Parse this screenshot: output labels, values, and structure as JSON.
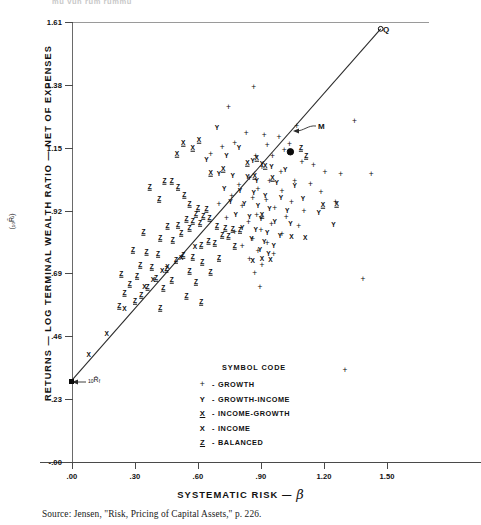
{
  "top_cut_text": "mu  vun  rum  rummu",
  "source_note": "Source: Jensen, \"Risk, Pricing of Capital Assets,\" p. 226.",
  "axis": {
    "y_title": "RETURNS  —  LOG TERMINAL WEALTH RATIO  —  NET OF EXPENSES",
    "y_subscript": "(₁₀R̄ᵢ)",
    "x_title": "SYSTEMATIC RISK  —",
    "x_symbol": "β"
  },
  "legend": {
    "title": "SYMBOL CODE",
    "dash": "-",
    "items": [
      {
        "symbol": "+",
        "style": "plus",
        "label": "GROWTH"
      },
      {
        "symbol": "Y",
        "style": "plain",
        "label": "GROWTH-INCOME"
      },
      {
        "symbol": "X",
        "style": "underline",
        "label": "INCOME-GROWTH"
      },
      {
        "symbol": "X",
        "style": "plain",
        "label": "INCOME"
      },
      {
        "symbol": "Z",
        "style": "underline",
        "label": "BALANCED"
      }
    ]
  },
  "annotations": [
    {
      "name": "market-portfolio-label",
      "text": "M",
      "x": 318,
      "y": 128
    },
    {
      "name": "q-point-label",
      "text": "Q",
      "x": 383,
      "y": 31
    },
    {
      "name": "riskfree-rate-label",
      "text": "₁₀R̄f",
      "x": 88,
      "y": 380
    }
  ],
  "chart_data": {
    "type": "scatter",
    "title": "",
    "xlabel": "SYSTEMATIC RISK — β",
    "ylabel": "RETURNS — LOG TERMINAL WEALTH RATIO — NET OF EXPENSES (₁₀R̄ᵢ)",
    "xlim": [
      0.0,
      1.7
    ],
    "ylim": [
      -0.0,
      1.61
    ],
    "xticks": [
      0.0,
      0.3,
      0.6,
      0.9,
      1.2,
      1.5
    ],
    "xticklabels": [
      ".00",
      ".30",
      ".60",
      ".90",
      "1.20",
      "1.50"
    ],
    "yticks": [
      0.0,
      0.23,
      0.46,
      0.69,
      0.92,
      1.15,
      1.38,
      1.61
    ],
    "yticklabels": [
      "-.00",
      ".23",
      ".46",
      ".69",
      ".92",
      "1.15",
      "1.38",
      "1.61"
    ],
    "grid": false,
    "legend_position": "inside-lower-center",
    "regression_line": {
      "name": "market-line",
      "label": "Security Market Line",
      "x_start": 0.0,
      "y_start": 0.3,
      "x_end": 1.47,
      "y_end": 1.585
    },
    "reference_points": [
      {
        "label": "₁₀R̄f",
        "x": 0.0,
        "y": 0.3
      },
      {
        "label": "M",
        "x": 1.04,
        "y": 1.135
      },
      {
        "label": "Q",
        "x": 1.47,
        "y": 1.585
      }
    ],
    "series": [
      {
        "name": "GROWTH",
        "symbol": "+",
        "style": "plus",
        "points": [
          [
            0.865,
            1.372
          ],
          [
            0.745,
            1.3
          ],
          [
            1.07,
            1.23
          ],
          [
            1.345,
            1.248
          ],
          [
            0.83,
            1.205
          ],
          [
            0.915,
            1.196
          ],
          [
            0.985,
            1.19
          ],
          [
            1.035,
            1.165
          ],
          [
            0.775,
            1.168
          ],
          [
            0.715,
            1.152
          ],
          [
            0.93,
            1.16
          ],
          [
            1.01,
            1.14
          ],
          [
            0.875,
            1.121
          ],
          [
            0.955,
            1.118
          ],
          [
            0.66,
            1.128
          ],
          [
            1.095,
            1.098
          ],
          [
            1.15,
            1.085
          ],
          [
            0.905,
            1.078
          ],
          [
            0.995,
            1.062
          ],
          [
            1.205,
            1.06
          ],
          [
            1.28,
            1.052
          ],
          [
            1.425,
            1.055
          ],
          [
            0.845,
            1.04
          ],
          [
            0.94,
            1.03
          ],
          [
            1.06,
            1.028
          ],
          [
            1.135,
            1.018
          ],
          [
            0.795,
            1.015
          ],
          [
            0.885,
            0.998
          ],
          [
            1.0,
            0.992
          ],
          [
            1.185,
            0.988
          ],
          [
            0.76,
            0.975
          ],
          [
            0.86,
            0.966
          ],
          [
            0.925,
            0.958
          ],
          [
            1.045,
            0.95
          ],
          [
            1.255,
            0.95
          ],
          [
            0.7,
            0.944
          ],
          [
            0.81,
            0.935
          ],
          [
            0.965,
            0.928
          ],
          [
            1.105,
            0.92
          ],
          [
            0.88,
            0.905
          ],
          [
            1.02,
            0.898
          ],
          [
            0.735,
            0.892
          ],
          [
            0.84,
            0.88
          ],
          [
            0.95,
            0.872
          ],
          [
            1.08,
            0.862
          ],
          [
            0.9,
            0.848
          ],
          [
            0.775,
            0.84
          ],
          [
            1.0,
            0.835
          ],
          [
            0.86,
            0.815
          ],
          [
            0.93,
            0.8
          ],
          [
            0.81,
            0.79
          ],
          [
            0.885,
            0.772
          ],
          [
            0.96,
            0.762
          ],
          [
            0.845,
            0.742
          ],
          [
            0.905,
            0.72
          ],
          [
            0.87,
            0.69
          ],
          [
            1.385,
            0.668
          ],
          [
            0.895,
            0.64
          ],
          [
            1.3,
            0.335
          ]
        ]
      },
      {
        "name": "GROWTH-INCOME",
        "symbol": "Y",
        "style": "plain",
        "points": [
          [
            0.69,
            1.222
          ],
          [
            0.795,
            1.148
          ],
          [
            0.735,
            1.12
          ],
          [
            0.64,
            1.105
          ],
          [
            0.86,
            1.1
          ],
          [
            0.905,
            1.092
          ],
          [
            0.95,
            1.078
          ],
          [
            1.015,
            1.068
          ],
          [
            0.7,
            1.055
          ],
          [
            0.765,
            1.048
          ],
          [
            0.835,
            1.042
          ],
          [
            0.88,
            1.03
          ],
          [
            0.975,
            1.02
          ],
          [
            1.06,
            1.01
          ],
          [
            0.725,
            1.0
          ],
          [
            0.8,
            0.992
          ],
          [
            0.865,
            0.985
          ],
          [
            0.92,
            0.975
          ],
          [
            0.995,
            0.965
          ],
          [
            1.1,
            0.962
          ],
          [
            0.755,
            0.95
          ],
          [
            0.82,
            0.944
          ],
          [
            0.885,
            0.936
          ],
          [
            0.94,
            0.925
          ],
          [
            1.025,
            0.918
          ],
          [
            1.175,
            0.912
          ],
          [
            0.78,
            0.905
          ],
          [
            0.845,
            0.896
          ],
          [
            0.9,
            0.888
          ],
          [
            0.965,
            0.878
          ],
          [
            1.04,
            0.87
          ],
          [
            1.245,
            0.866
          ],
          [
            0.81,
            0.858
          ],
          [
            0.875,
            0.85
          ],
          [
            0.93,
            0.838
          ],
          [
            0.99,
            0.828
          ],
          [
            0.855,
            0.815
          ],
          [
            0.915,
            0.805
          ],
          [
            0.96,
            0.792
          ],
          [
            0.895,
            0.775
          ],
          [
            0.935,
            0.76
          ]
        ]
      },
      {
        "name": "INCOME-GROWTH",
        "symbol": "X",
        "style": "underline",
        "points": [
          [
            0.605,
            1.178
          ],
          [
            0.53,
            1.168
          ],
          [
            0.88,
            1.112
          ],
          [
            0.835,
            1.095
          ],
          [
            0.92,
            1.082
          ],
          [
            0.72,
            1.072
          ],
          [
            0.66,
            1.058
          ],
          [
            0.87,
            1.048
          ],
          [
            0.955,
            1.038
          ],
          [
            1.26,
            0.945
          ],
          [
            1.195,
            0.942
          ],
          [
            0.905,
            0.905
          ],
          [
            0.575,
            1.148
          ],
          [
            0.5,
            1.128
          ]
        ]
      },
      {
        "name": "INCOME",
        "symbol": "X",
        "style": "plain",
        "points": [
          [
            0.165,
            0.47
          ],
          [
            0.25,
            0.56
          ],
          [
            0.385,
            0.665
          ],
          [
            0.455,
            0.712
          ],
          [
            0.52,
            0.745
          ],
          [
            0.585,
            0.786
          ],
          [
            0.43,
            0.7
          ],
          [
            0.345,
            0.64
          ],
          [
            0.905,
            0.742
          ],
          [
            0.945,
            0.738
          ],
          [
            0.86,
            0.735
          ],
          [
            1.045,
            0.822
          ],
          [
            1.11,
            0.818
          ],
          [
            0.08,
            0.392
          ]
        ]
      },
      {
        "name": "BALANCED",
        "symbol": "Z",
        "style": "underline",
        "points": [
          [
            0.37,
            1.005
          ],
          [
            0.44,
            1.03
          ],
          [
            0.475,
            1.028
          ],
          [
            0.505,
            1.008
          ],
          [
            0.535,
            0.978
          ],
          [
            0.415,
            0.962
          ],
          [
            0.56,
            0.945
          ],
          [
            0.6,
            0.93
          ],
          [
            0.64,
            0.925
          ],
          [
            0.59,
            0.908
          ],
          [
            0.625,
            0.9
          ],
          [
            0.655,
            0.892
          ],
          [
            0.545,
            0.89
          ],
          [
            0.575,
            0.882
          ],
          [
            0.61,
            0.875
          ],
          [
            0.505,
            0.868
          ],
          [
            0.69,
            0.862
          ],
          [
            0.73,
            0.858
          ],
          [
            0.765,
            0.852
          ],
          [
            0.8,
            0.848
          ],
          [
            0.455,
            0.862
          ],
          [
            0.56,
            0.855
          ],
          [
            0.34,
            0.84
          ],
          [
            0.52,
            0.838
          ],
          [
            0.715,
            0.832
          ],
          [
            0.745,
            0.828
          ],
          [
            0.42,
            0.82
          ],
          [
            0.48,
            0.812
          ],
          [
            0.65,
            0.808
          ],
          [
            0.68,
            0.8
          ],
          [
            0.615,
            0.795
          ],
          [
            0.775,
            0.79
          ],
          [
            0.29,
            0.775
          ],
          [
            0.355,
            0.768
          ],
          [
            0.41,
            0.762
          ],
          [
            0.53,
            0.758
          ],
          [
            0.575,
            0.75
          ],
          [
            0.7,
            0.745
          ],
          [
            0.495,
            0.738
          ],
          [
            0.62,
            0.73
          ],
          [
            0.325,
            0.722
          ],
          [
            0.38,
            0.715
          ],
          [
            0.45,
            0.708
          ],
          [
            0.56,
            0.7
          ],
          [
            0.66,
            0.695
          ],
          [
            0.235,
            0.688
          ],
          [
            0.31,
            0.68
          ],
          [
            0.4,
            0.672
          ],
          [
            0.475,
            0.665
          ],
          [
            0.59,
            0.66
          ],
          [
            0.275,
            0.65
          ],
          [
            0.36,
            0.642
          ],
          [
            0.435,
            0.635
          ],
          [
            0.25,
            0.62
          ],
          [
            0.33,
            0.612
          ],
          [
            0.545,
            0.608
          ],
          [
            0.3,
            0.588
          ],
          [
            0.615,
            0.585
          ],
          [
            0.225,
            0.57
          ],
          [
            0.42,
            0.562
          ],
          [
            1.09,
            1.15
          ],
          [
            1.115,
            1.118
          ]
        ]
      }
    ]
  }
}
